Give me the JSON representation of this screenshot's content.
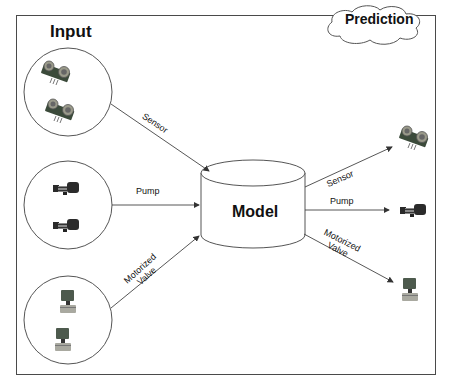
{
  "diagram": {
    "input_title": "Input",
    "prediction_title": "Prediction",
    "model_label": "Model",
    "inputs": [
      {
        "label": "Sensor",
        "icon": "ultrasonic-sensor-icon"
      },
      {
        "label": "Pump",
        "icon": "water-pump-icon"
      },
      {
        "label_line1": "Motorized",
        "label_line2": "Valve",
        "icon": "motorized-valve-icon"
      }
    ],
    "outputs": [
      {
        "label": "Sensor",
        "icon": "ultrasonic-sensor-icon"
      },
      {
        "label": "Pump",
        "icon": "water-pump-icon"
      },
      {
        "label_line1": "Motorized",
        "label_line2": "Valve",
        "icon": "motorized-valve-icon"
      }
    ],
    "colors": {
      "line": "#444444",
      "text": "#111111",
      "background": "#ffffff"
    }
  }
}
